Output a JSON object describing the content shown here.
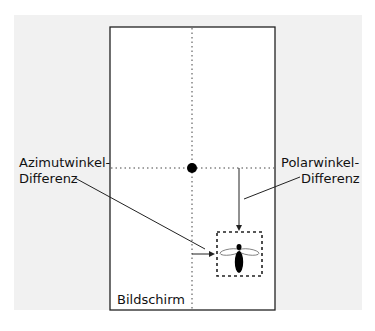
{
  "diagram": {
    "screen_label": "Bildschirm",
    "left_label": {
      "line1": "Azimutwinkel-",
      "line2": "Differenz"
    },
    "right_label": {
      "line1": "Polarwinkel-",
      "line2": "Differenz"
    }
  },
  "colors": {
    "background": "#f1f1f1",
    "screen_fill": "#ffffff",
    "stroke": "#222222"
  }
}
